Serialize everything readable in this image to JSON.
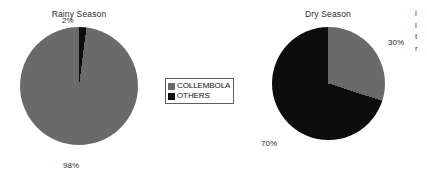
{
  "figure": {
    "background_color": "#ffffff",
    "marginal_text_fragments": [
      "l",
      "l",
      "t",
      "r"
    ]
  },
  "legend": {
    "items": [
      {
        "label": "COLLEMBOLA",
        "color": "#6a6a6a",
        "swatch_icon": "legend-swatch-gray"
      },
      {
        "label": "OTHERS",
        "color": "#0d0d0d",
        "swatch_icon": "legend-swatch-black"
      }
    ]
  },
  "charts": [
    {
      "title": "Rainy Season",
      "labels": {
        "collembola": "2%",
        "others": "98%"
      }
    },
    {
      "title": "Dry Season",
      "labels": {
        "collembola": "30%",
        "others": "70%"
      }
    }
  ],
  "chart_data": [
    {
      "type": "pie",
      "title": "Rainy Season",
      "categories": [
        "OTHERS",
        "COLLEMBOLA"
      ],
      "values": [
        2,
        98
      ],
      "data_labels": [
        "2%",
        "98%"
      ],
      "colors": [
        "#0d0d0d",
        "#6a6a6a"
      ],
      "start_angle_deg": 0,
      "direction": "clockwise",
      "legend_position": "center-between-charts",
      "grid": false,
      "xlabel": "",
      "ylabel": ""
    },
    {
      "type": "pie",
      "title": "Dry Season",
      "categories": [
        "COLLEMBOLA",
        "OTHERS"
      ],
      "values": [
        30,
        70
      ],
      "data_labels": [
        "30%",
        "70%"
      ],
      "colors": [
        "#6a6a6a",
        "#0d0d0d"
      ],
      "start_angle_deg": 0,
      "direction": "clockwise",
      "legend_position": "center-between-charts",
      "grid": false,
      "xlabel": "",
      "ylabel": ""
    }
  ]
}
